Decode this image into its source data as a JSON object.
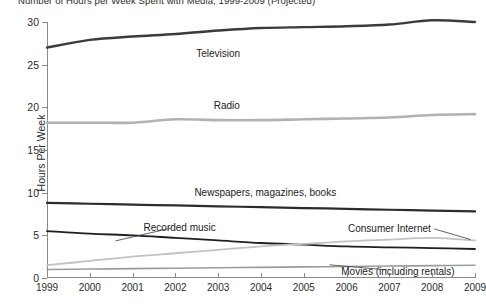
{
  "chart_data": {
    "type": "line",
    "title": "Number of Hours per Week Spent with Media, 1999-2009 (Projected)",
    "xlabel": "",
    "ylabel": "Hours Per Week",
    "ylim": [
      0,
      30
    ],
    "xlim": [
      1999,
      2009
    ],
    "grid": false,
    "legend_position": "inline-labels",
    "categories": [
      "1999",
      "2000",
      "2001",
      "2002",
      "2003",
      "2004",
      "2005",
      "2006",
      "2007",
      "2008",
      "2009"
    ],
    "yticks": [
      "0",
      "5",
      "10",
      "15",
      "20",
      "25",
      "30"
    ],
    "series": [
      {
        "name": "Television",
        "color": "#3b3b3b",
        "width": 2.4,
        "values": [
          27.0,
          27.9,
          28.3,
          28.6,
          29.0,
          29.3,
          29.4,
          29.5,
          29.7,
          30.2,
          30.0
        ],
        "label_x": 2003.0,
        "label_y": 26.4
      },
      {
        "name": "Radio",
        "color": "#b2b2b2",
        "width": 2.6,
        "values": [
          18.2,
          18.2,
          18.2,
          18.6,
          18.5,
          18.5,
          18.6,
          18.7,
          18.8,
          19.1,
          19.2
        ],
        "label_x": 2003.2,
        "label_y": 20.3
      },
      {
        "name": "Newspapers, magazines, books",
        "color": "#2c2c2c",
        "width": 2.2,
        "values": [
          8.8,
          8.7,
          8.6,
          8.5,
          8.4,
          8.3,
          8.2,
          8.1,
          8.0,
          7.9,
          7.8
        ],
        "label_x": 2004.1,
        "label_y": 10.1
      },
      {
        "name": "Recorded music",
        "color": "#1f1f1f",
        "width": 1.8,
        "values": [
          5.5,
          5.2,
          5.0,
          4.7,
          4.4,
          4.1,
          3.9,
          3.7,
          3.6,
          3.5,
          3.4
        ],
        "label_x": 2002.1,
        "label_y": 6.0
      },
      {
        "name": "Consumer Internet",
        "color": "#c2c2c2",
        "width": 1.8,
        "values": [
          1.5,
          2.0,
          2.5,
          2.9,
          3.3,
          3.7,
          4.0,
          4.3,
          4.5,
          4.7,
          4.4
        ],
        "label_x": 2007.0,
        "label_y": 5.9
      },
      {
        "name": "Movies (including rentals)",
        "color": "#9b9b9b",
        "width": 1.6,
        "values": [
          1.0,
          1.05,
          1.1,
          1.15,
          1.2,
          1.25,
          1.3,
          1.35,
          1.4,
          1.45,
          1.5
        ],
        "label_x": 2007.2,
        "label_y": 0.85
      }
    ],
    "annotations": [
      {
        "name": "recorded-music-leader",
        "text": "",
        "from": [
          2001.9,
          5.85
        ],
        "to": [
          2000.6,
          4.35
        ]
      },
      {
        "name": "consumer-internet-leader",
        "text": "",
        "from": [
          2008.05,
          5.75
        ],
        "to": [
          2008.9,
          4.5
        ]
      },
      {
        "name": "movies-leader",
        "text": "",
        "from": [
          2006.95,
          0.95
        ],
        "to": [
          2005.6,
          1.55
        ]
      }
    ]
  }
}
